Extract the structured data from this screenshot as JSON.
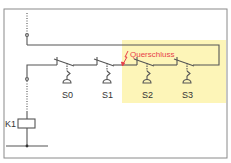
{
  "diagram": {
    "type": "circuit-schematic",
    "frame_color": "#8a8a8a",
    "line_color": "#555555",
    "highlight_color": "#fdf5b8",
    "fault_color": "#e8404a",
    "fault_label": "Querschluss",
    "coil_label": "K1",
    "switches": [
      {
        "id": "S0",
        "label": "S0"
      },
      {
        "id": "S1",
        "label": "S1"
      },
      {
        "id": "S2",
        "label": "S2"
      },
      {
        "id": "S3",
        "label": "S3"
      }
    ],
    "highlighted_switches": [
      "S2",
      "S3"
    ]
  }
}
